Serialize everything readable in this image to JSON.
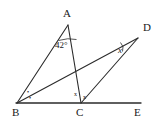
{
  "figure": {
    "type": "geometry-diagram",
    "background_color": "#ffffff",
    "stroke_color": "#2b2b2b",
    "width": 163,
    "height": 124,
    "points": [
      {
        "id": "A",
        "label": "A",
        "x": 68,
        "y": 25,
        "label_x": 63,
        "label_y": 8
      },
      {
        "id": "B",
        "label": "B",
        "x": 17,
        "y": 103,
        "label_x": 12,
        "label_y": 107
      },
      {
        "id": "C",
        "label": "C",
        "x": 81,
        "y": 103,
        "label_x": 76,
        "label_y": 107
      },
      {
        "id": "D",
        "label": "D",
        "x": 138,
        "y": 38,
        "label_x": 143,
        "label_y": 22
      },
      {
        "id": "E",
        "label": "E",
        "x": 140,
        "y": 103,
        "label_x": 134,
        "label_y": 107
      }
    ],
    "segments": [
      {
        "name": "segment-BA",
        "from": "B",
        "to": "A"
      },
      {
        "name": "segment-AC",
        "from": "A",
        "to": "C"
      },
      {
        "name": "segment-BD",
        "from": "B",
        "to": "D"
      },
      {
        "name": "segment-CD",
        "from": "C",
        "to": "D"
      },
      {
        "name": "segment-BE",
        "from": "B",
        "to": "E"
      }
    ],
    "angle_labels": [
      {
        "name": "angle-at-A",
        "text": "42°",
        "x": 55,
        "y": 41,
        "italic": false
      },
      {
        "name": "angle-at-D",
        "text": "x",
        "x": 118,
        "y": 46,
        "italic": true
      }
    ],
    "congruence_marks": [
      {
        "name": "angle-mark-B-upper",
        "symbol": "•",
        "x": 27,
        "y": 89
      },
      {
        "name": "angle-mark-B-lower",
        "symbol": "•",
        "x": 29,
        "y": 95
      },
      {
        "name": "angle-mark-C-left",
        "symbol": "x",
        "x": 74,
        "y": 91
      },
      {
        "name": "angle-mark-C-right",
        "symbol": "x",
        "x": 83,
        "y": 94
      }
    ]
  }
}
